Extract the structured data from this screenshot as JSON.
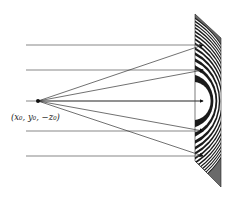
{
  "diagram": {
    "source_label": "(x₀, y₀, −z₀)",
    "source_point": {
      "x": 38,
      "y": 101
    },
    "plane_wave_rays_y": [
      45,
      70,
      101,
      131,
      156
    ],
    "ray_start_x": 26,
    "ray_end_x": 203,
    "point_source_targets_y": [
      45,
      70,
      101,
      131,
      156
    ],
    "plate": {
      "corners": [
        [
          195,
          14
        ],
        [
          221,
          38
        ],
        [
          221,
          187
        ],
        [
          195,
          161
        ]
      ],
      "fringe_center": {
        "x": 204,
        "y": 101
      },
      "colors": {
        "dark": "#1a1a1a",
        "light": "#ffffff",
        "mid": "#5a5a5a"
      }
    },
    "line_color": "#555555"
  }
}
